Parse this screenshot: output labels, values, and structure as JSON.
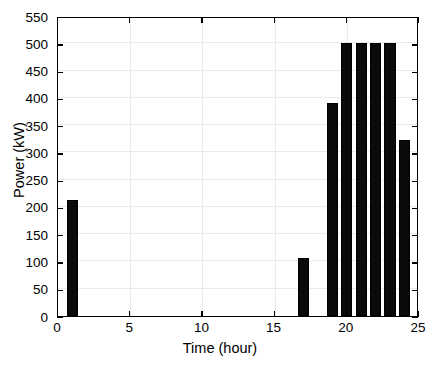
{
  "chart_data": {
    "type": "bar",
    "title": "",
    "xlabel": "Time (hour)",
    "ylabel": "Power (kW)",
    "xlim": [
      0,
      25
    ],
    "ylim": [
      0,
      550
    ],
    "grid": true,
    "legend": null,
    "bar_color": "#000000",
    "background_color": "#ffffff",
    "x_ticks": [
      0,
      5,
      10,
      15,
      20,
      25
    ],
    "y_ticks": [
      0,
      50,
      100,
      150,
      200,
      250,
      300,
      350,
      400,
      450,
      500,
      550
    ],
    "x_tick_labels": [
      "0",
      "5",
      "10",
      "15",
      "20",
      "25"
    ],
    "y_tick_labels": [
      "0",
      "50",
      "100",
      "150",
      "200",
      "250",
      "300",
      "350",
      "400",
      "450",
      "500",
      "550"
    ],
    "categories": [
      1,
      2,
      3,
      4,
      5,
      6,
      7,
      8,
      9,
      10,
      11,
      12,
      13,
      14,
      15,
      16,
      17,
      18,
      19,
      20,
      21,
      22,
      23,
      24
    ],
    "values": [
      213,
      0,
      0,
      0,
      0,
      0,
      0,
      0,
      0,
      0,
      0,
      0,
      0,
      0,
      0,
      0,
      107,
      0,
      390,
      500,
      500,
      500,
      500,
      322
    ],
    "series": [
      {
        "name": "Power",
        "values": [
          213,
          0,
          0,
          0,
          0,
          0,
          0,
          0,
          0,
          0,
          0,
          0,
          0,
          0,
          0,
          0,
          107,
          0,
          390,
          500,
          500,
          500,
          500,
          322
        ]
      }
    ],
    "bars": [
      {
        "hour": 1,
        "value": 213
      },
      {
        "hour": 17,
        "value": 107
      },
      {
        "hour": 19,
        "value": 390
      },
      {
        "hour": 20,
        "value": 500
      },
      {
        "hour": 21,
        "value": 500
      },
      {
        "hour": 22,
        "value": 500
      },
      {
        "hour": 23,
        "value": 500
      },
      {
        "hour": 24,
        "value": 322
      }
    ]
  }
}
